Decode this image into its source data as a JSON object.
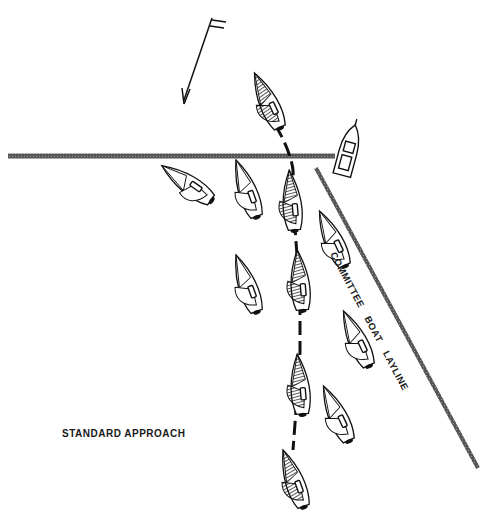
{
  "diagram": {
    "title": "STANDARD APPROACH",
    "layline_label": "COMMITTEE BOAT   LAYLINE",
    "wind_indicator": "wind-arrow",
    "elements": {
      "start_line": {
        "x1": 8,
        "y1": 156,
        "x2": 335,
        "y2": 156
      },
      "layline": {
        "x1": 316,
        "y1": 168,
        "x2": 478,
        "y2": 468
      },
      "committee_boat": {
        "x": 348,
        "y": 152,
        "angle": 15
      },
      "highlighted_boats": [
        {
          "x": 270,
          "y": 100,
          "angle": -25
        },
        {
          "x": 293,
          "y": 200,
          "angle": -5
        },
        {
          "x": 300,
          "y": 280,
          "angle": -5
        },
        {
          "x": 300,
          "y": 385,
          "angle": -5
        },
        {
          "x": 295,
          "y": 480,
          "angle": -20
        }
      ],
      "other_boats": [
        {
          "x": 185,
          "y": 185,
          "angle": -55
        },
        {
          "x": 245,
          "y": 190,
          "angle": -20
        },
        {
          "x": 330,
          "y": 240,
          "angle": -25
        },
        {
          "x": 245,
          "y": 285,
          "angle": -20
        },
        {
          "x": 355,
          "y": 340,
          "angle": -25
        },
        {
          "x": 335,
          "y": 415,
          "angle": -25
        }
      ]
    }
  }
}
